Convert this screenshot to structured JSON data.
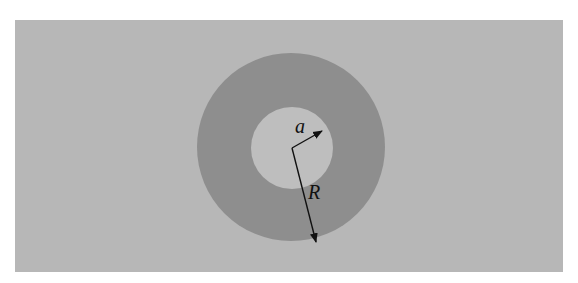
{
  "figure": {
    "type": "annulus-cross-section",
    "colors": {
      "background": "#b7b7b7",
      "annulus": "#8e8e8e",
      "inner_hole": "#bebebe",
      "arrows": "#111111"
    },
    "labels": {
      "inner_radius": "a",
      "outer_radius": "R"
    }
  }
}
